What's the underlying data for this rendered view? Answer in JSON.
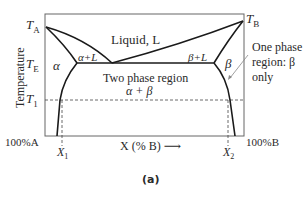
{
  "figure": {
    "caption": "(a)",
    "y_axis_label": "Temperature",
    "x_axis_label": "X (% B) ⟶",
    "left_end_label": "100%A",
    "right_end_label": "100%B",
    "temp_labels": {
      "ta_main": "T",
      "ta_sub": "A",
      "tb_main": "T",
      "tb_sub": "B",
      "te_main": "T",
      "te_sub": "E",
      "t1_main": "T",
      "t1_sub": "1"
    },
    "composition_labels": {
      "x1_main": "X",
      "x1_sub": "1",
      "x2_main": "X",
      "x2_sub": "2"
    },
    "regions": {
      "liquid": "Liquid, L",
      "alpha_plus_l": "α+L",
      "beta_plus_l": "β+L",
      "alpha": "α",
      "beta": "β",
      "two_phase_line1": "Two phase region",
      "two_phase_line2": "α + β"
    },
    "annotation": {
      "line1": "One phase",
      "line2": "region: β",
      "line3": "only"
    },
    "colors": {
      "curve": "#1a1a1a",
      "frame": "#555555",
      "dashed": "#444444",
      "text": "#2a2a2a"
    }
  }
}
